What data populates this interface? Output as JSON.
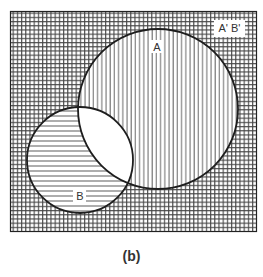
{
  "diagram": {
    "type": "venn",
    "caption": "(b)",
    "universe_label": "A' B'",
    "sets": [
      {
        "name": "A",
        "label": "A",
        "shading": "vertical-lines"
      },
      {
        "name": "B",
        "label": "B",
        "shading": "horizontal-lines"
      }
    ],
    "regions": [
      {
        "name": "A only (A B')",
        "shading": "vertical-lines"
      },
      {
        "name": "B only (A' B)",
        "shading": "horizontal-lines"
      },
      {
        "name": "A and B (A B)",
        "shading": "none"
      },
      {
        "name": "neither (A' B')",
        "shading": "cross-hatch"
      }
    ],
    "colors": {
      "line": "#222222",
      "hatch": "#555555",
      "background": "#ffffff"
    }
  }
}
